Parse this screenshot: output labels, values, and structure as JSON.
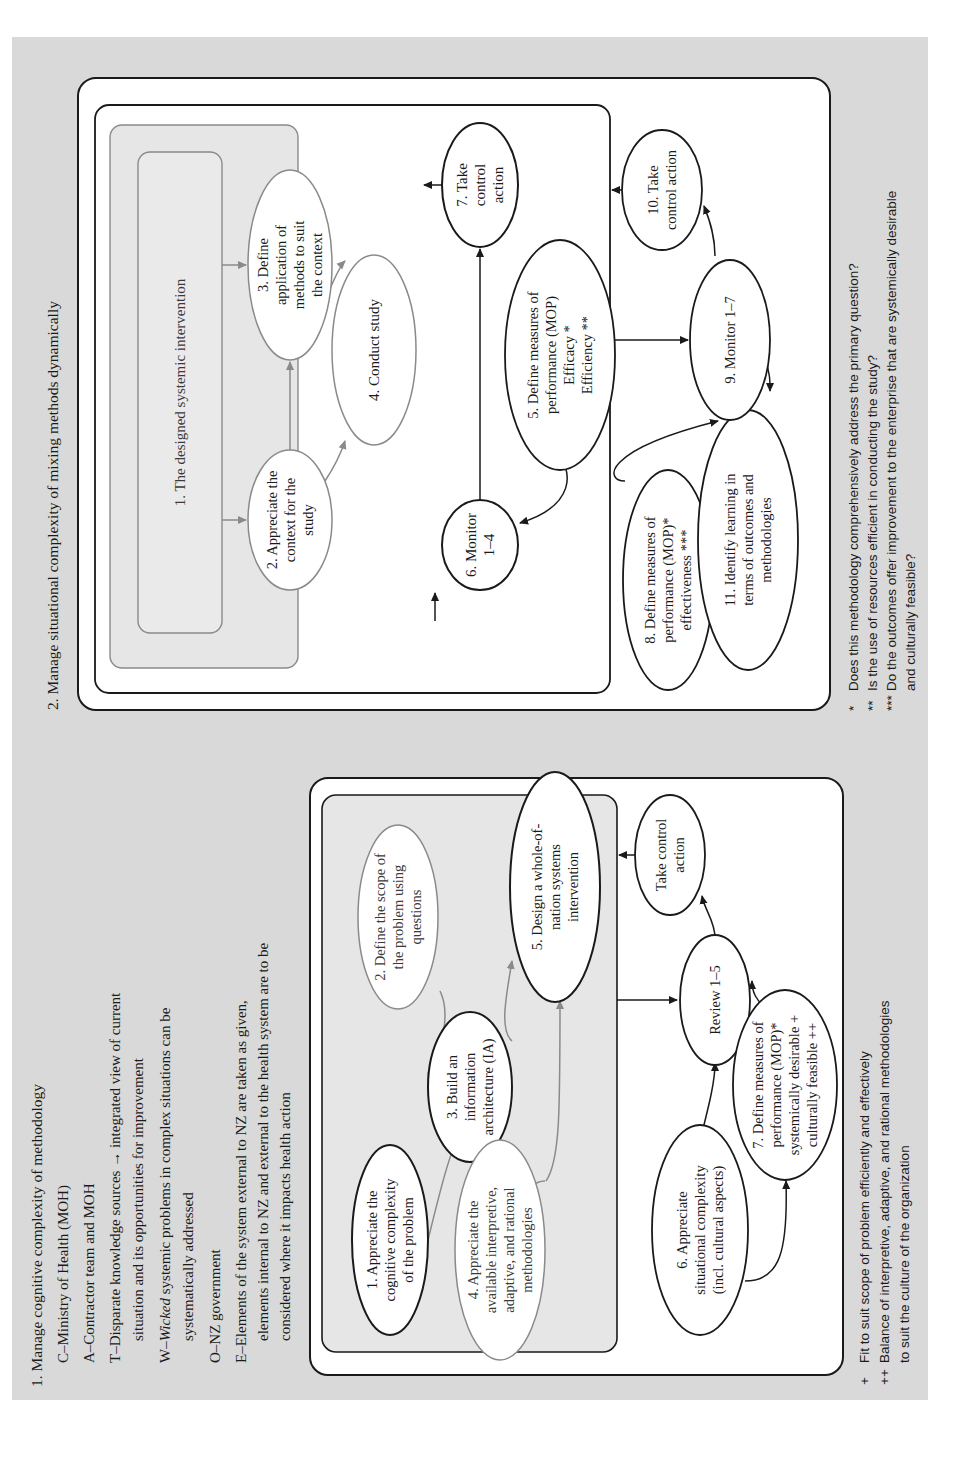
{
  "section1": {
    "title": "1. Manage cognitive complexity of methodology",
    "catwoe": [
      {
        "line1": "C–Ministry of Health (MOH)"
      },
      {
        "line1": "A–Contractor team and MOH"
      },
      {
        "line1": "T–Disparate knowledge sources → integrated view of current",
        "line2": "situation and its opportunities for improvement"
      },
      {
        "prefix": "W–",
        "italic": "Wicked",
        "rest": " systemic problems in complex situations can be",
        "line2": "systematically addressed"
      },
      {
        "line1": "O–NZ government"
      },
      {
        "line1": "E–Elements of the system external to NZ are taken as given,",
        "line2": "elements internal to NZ and external to the health system are to be",
        "line3": "considered where it impacts health action"
      }
    ],
    "nodes": [
      {
        "id": "n1",
        "label": "1. Appreciate the\ncognitive complexity\nof the problem"
      },
      {
        "id": "n2",
        "label": "2. Define the scope of\nthe problem using\nquestions"
      },
      {
        "id": "n3",
        "label": "3. Build an\ninformation\narchitecture (IA)"
      },
      {
        "id": "n4",
        "label": "4. Appreciate the\navailable interpretive,\nadaptive, and rational\nmethodologies"
      },
      {
        "id": "n5",
        "label": "5. Design a whole-of-\nnation systems\nintervention"
      },
      {
        "id": "n6",
        "label": "6. Appreciate\nsituational complexity\n(incl. cultural aspects)"
      },
      {
        "id": "n7",
        "label": "7. Define measures of\nperformance (MOP)*\nsystemically desirable +\nculturally feasible ++"
      },
      {
        "id": "review",
        "label": "Review 1–5"
      },
      {
        "id": "control",
        "label": "Take control\naction"
      }
    ],
    "legend": [
      {
        "mark": "+",
        "text": "Fit to suit scope of problem efficiently and effectively"
      },
      {
        "mark": "++",
        "text": "Balance of interpretive, adaptive, and rational methodologies"
      },
      {
        "mark": "",
        "text": "to suit the culture of the organization"
      }
    ]
  },
  "section2": {
    "title": "2. Manage situational complexity of mixing methods dynamically",
    "nodes": [
      {
        "id": "n1",
        "label": "1. The designed systemic intervention"
      },
      {
        "id": "n2",
        "label": "2. Appreciate the\ncontext for the\nstudy"
      },
      {
        "id": "n3",
        "label": "3. Define\napplication of\nmethods to suit\nthe context"
      },
      {
        "id": "n4",
        "label": "4. Conduct study"
      },
      {
        "id": "n5",
        "label": "5. Define measures of\nperformance (MOP)\nEfficacy *\nEfficiency **"
      },
      {
        "id": "n6",
        "label": "6. Monitor\n1–4"
      },
      {
        "id": "n7",
        "label": "7. Take\ncontrol\naction"
      },
      {
        "id": "n8",
        "label": "8. Define measures of\nperformance (MOP)*\neffectiveness ***"
      },
      {
        "id": "n9",
        "label": "9. Monitor 1–7"
      },
      {
        "id": "n10",
        "label": "10. Take\ncontrol action"
      },
      {
        "id": "n11",
        "label": "11. Identify learning in\nterms of outcomes and\nmethodologies"
      }
    ],
    "legend": [
      {
        "mark": "*",
        "text": "Does this methodology comprehensively address the primary question?"
      },
      {
        "mark": "**",
        "text": "Is the use of resources efficient in conducting the study?"
      },
      {
        "mark": "***",
        "text": "Do the outcomes offer improvement to the enterprise that are systemically desirable"
      },
      {
        "mark": "",
        "text": "and culturally feasible?"
      }
    ]
  },
  "colors": {
    "page_bg": "#d9d9d9",
    "box_fill": "#ffffff",
    "inner_fill": "#e6e6e6",
    "stroke": "#1a1a1a",
    "grey_stroke": "#8a8a8a"
  }
}
